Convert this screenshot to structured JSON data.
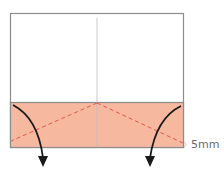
{
  "diagram": {
    "type": "origami-fold-instruction",
    "paper": {
      "fill": "#ffffff",
      "border_color": "#8c8c8c"
    },
    "folded_band": {
      "fill": "#f7b8a0",
      "border_color": "#8c8c8c"
    },
    "center_crease_color": "#bdbdbd",
    "dashed_fold_color": "#e0574a",
    "arrow_color": "#1a1a1a",
    "measurement_label": "5mm",
    "label_color": "#6b6b6b"
  }
}
